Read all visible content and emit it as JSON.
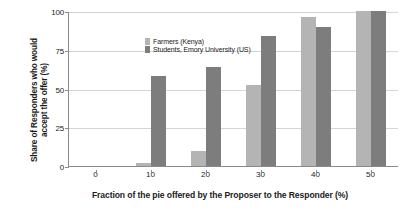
{
  "chart_data": {
    "type": "bar",
    "title": "",
    "xlabel": "Fraction of the pie offered by the Proposer to the Responder (%)",
    "ylabel_line1": "Share of Responders who would",
    "ylabel_line2": "accept the offer (%)",
    "categories": [
      "0",
      "10",
      "20",
      "30",
      "40",
      "50"
    ],
    "series": [
      {
        "name": "Farmers (Kenya)",
        "color": "#b4b4b4",
        "values": [
          0,
          2,
          10,
          52,
          96,
          100
        ]
      },
      {
        "name": "Students, Emory University (US)",
        "color": "#7d7d7d",
        "values": [
          0,
          58,
          64,
          84,
          90,
          100
        ]
      }
    ],
    "ylim": [
      0,
      100
    ],
    "yticks": [
      "0",
      "25",
      "50",
      "75",
      "100"
    ],
    "ytick_values": [
      0,
      25,
      50,
      75,
      100
    ],
    "xticks": [
      "0",
      "10",
      "20",
      "30",
      "40",
      "50"
    ],
    "grid": true,
    "legend_position": "top-left"
  }
}
